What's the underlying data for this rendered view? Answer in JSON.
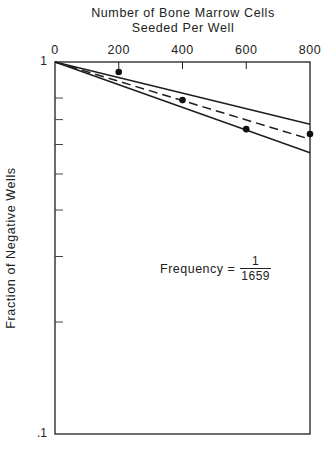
{
  "chart_data": {
    "type": "scatter",
    "title_lines": [
      "Number of Bone Marrow Cells",
      "Seeded Per Well"
    ],
    "xlabel": "Number of Bone Marrow Cells Seeded Per Well",
    "ylabel": "Fraction of Negative Wells",
    "x_axis_position": "top",
    "xlim": [
      0,
      800
    ],
    "ylim": [
      0.1,
      1
    ],
    "yscale": "log",
    "xticks": [
      0,
      200,
      400,
      600,
      800
    ],
    "xtick_labels": [
      "0",
      "200",
      "400",
      "600",
      "800"
    ],
    "yticks_labeled": [
      1,
      0.1
    ],
    "ytick_labels": [
      "1",
      ".1"
    ],
    "yticks_minor": [
      0.8,
      0.7,
      0.6,
      0.5,
      0.4,
      0.3,
      0.2
    ],
    "grid": false,
    "series": [
      {
        "name": "Observed",
        "kind": "points",
        "x": [
          200,
          400,
          600,
          800
        ],
        "y": [
          0.94,
          0.79,
          0.66,
          0.64
        ]
      },
      {
        "name": "Fit (frequency 1/1659)",
        "kind": "dashed-line",
        "x": [
          0,
          800
        ],
        "y": [
          1,
          0.62
        ]
      },
      {
        "name": "Upper confidence limit",
        "kind": "solid-line",
        "x": [
          0,
          800
        ],
        "y": [
          1,
          0.68
        ]
      },
      {
        "name": "Lower confidence limit",
        "kind": "solid-line",
        "x": [
          0,
          800
        ],
        "y": [
          1,
          0.57
        ]
      }
    ],
    "annotations": [
      {
        "text": "Frequency = 1/1659",
        "numerator": "1",
        "denominator": "1659",
        "x": 400,
        "y": 0.3
      }
    ]
  },
  "labels": {
    "title_line1": "Number of Bone Marrow Cells",
    "title_line2": "Seeded Per Well",
    "ylabel": "Fraction of Negative Wells",
    "freq_prefix": "Frequency =",
    "freq_num": "1",
    "freq_den": "1659",
    "ytick_top": "1",
    "ytick_bottom": ".1"
  }
}
